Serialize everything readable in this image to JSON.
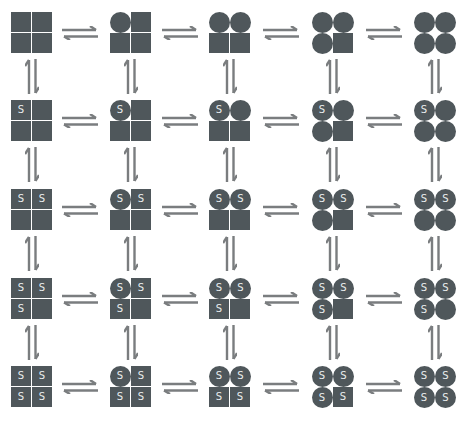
{
  "diagram": {
    "type": "equilibrium-grid",
    "colors": {
      "subunit_fill": "#4f575b",
      "ligand_text": "#e9ecec",
      "arrow": "#7a7d7f",
      "background": "#ffffff"
    },
    "ligand_label": "S",
    "rows": [
      {
        "ligands": [],
        "states": [
          {
            "circles": []
          },
          {
            "circles": [
              "tl"
            ]
          },
          {
            "circles": [
              "tl",
              "tr"
            ]
          },
          {
            "circles": [
              "tl",
              "tr",
              "bl"
            ]
          },
          {
            "circles": [
              "tl",
              "tr",
              "bl",
              "br"
            ]
          }
        ]
      },
      {
        "ligands": [
          "tl"
        ],
        "states": [
          {
            "circles": []
          },
          {
            "circles": [
              "tl"
            ]
          },
          {
            "circles": [
              "tl",
              "tr"
            ]
          },
          {
            "circles": [
              "tl",
              "tr",
              "bl"
            ]
          },
          {
            "circles": [
              "tl",
              "tr",
              "bl",
              "br"
            ]
          }
        ]
      },
      {
        "ligands": [
          "tl",
          "tr"
        ],
        "states": [
          {
            "circles": []
          },
          {
            "circles": [
              "tl"
            ]
          },
          {
            "circles": [
              "tl",
              "tr"
            ]
          },
          {
            "circles": [
              "tl",
              "tr",
              "bl"
            ]
          },
          {
            "circles": [
              "tl",
              "tr",
              "bl",
              "br"
            ]
          }
        ]
      },
      {
        "ligands": [
          "tl",
          "tr",
          "bl"
        ],
        "states": [
          {
            "circles": []
          },
          {
            "circles": [
              "tl"
            ]
          },
          {
            "circles": [
              "tl",
              "tr"
            ]
          },
          {
            "circles": [
              "tl",
              "tr",
              "bl"
            ]
          },
          {
            "circles": [
              "tl",
              "tr",
              "bl",
              "br"
            ]
          }
        ]
      },
      {
        "ligands": [
          "tl",
          "tr",
          "bl",
          "br"
        ],
        "states": [
          {
            "circles": []
          },
          {
            "circles": [
              "tl"
            ]
          },
          {
            "circles": [
              "tl",
              "tr"
            ]
          },
          {
            "circles": [
              "tl",
              "tr",
              "bl"
            ]
          },
          {
            "circles": [
              "tl",
              "tr",
              "bl",
              "br"
            ]
          }
        ]
      }
    ],
    "layout": {
      "col_x": [
        11,
        110,
        209,
        312,
        414
      ],
      "row_y": [
        12,
        100,
        189,
        278,
        366
      ],
      "harrow_x": [
        61,
        161,
        262,
        365
      ],
      "varrow_dx": 10
    }
  }
}
